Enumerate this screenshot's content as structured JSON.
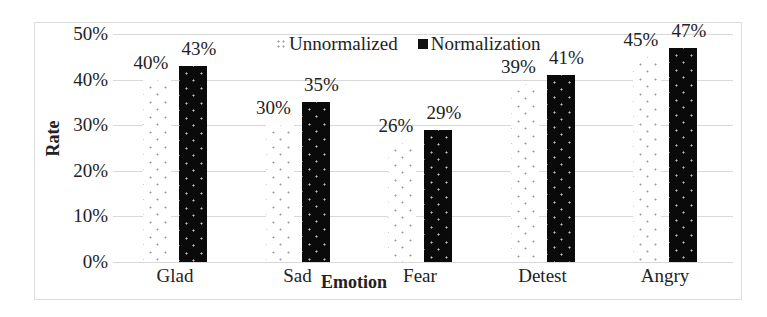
{
  "chart_data": {
    "type": "bar",
    "title": "",
    "xlabel": "Emotion",
    "ylabel": "Rate",
    "categories": [
      "Glad",
      "Sad",
      "Fear",
      "Detest",
      "Angry"
    ],
    "series": [
      {
        "name": "Unnormalized",
        "values": [
          40,
          30,
          26,
          39,
          45
        ],
        "labels": [
          "40%",
          "30%",
          "26%",
          "39%",
          "45%"
        ],
        "pattern": "sparse-dots-on-white"
      },
      {
        "name": "Normalization",
        "values": [
          43,
          35,
          29,
          41,
          47
        ],
        "labels": [
          "43%",
          "35%",
          "29%",
          "41%",
          "47%"
        ],
        "pattern": "white-dots-on-black"
      }
    ],
    "yticks": [
      "0%",
      "10%",
      "20%",
      "30%",
      "40%",
      "50%"
    ],
    "ylim": [
      0,
      50
    ],
    "grid": true,
    "legend_position": "top-inside",
    "colors": {
      "normalization": "#0a0a0a",
      "unnormalized_dots": "#9a9a9a",
      "gridline": "#d8d8d8"
    }
  }
}
